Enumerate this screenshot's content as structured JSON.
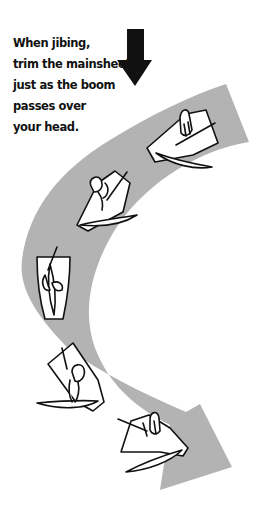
{
  "caption": {
    "lines": [
      "When jibing,",
      "trim the mainsheet",
      "just as the boom",
      "passes over",
      "your head."
    ]
  },
  "diagram": {
    "wind_arrow": {
      "icon": "wind-direction-down-arrow",
      "color": "#111111"
    },
    "path_arrow": {
      "icon": "curved-course-arrow",
      "color": "#b3b3b3"
    },
    "boats": [
      {
        "id": "boat-1",
        "stage": "approaching jibe"
      },
      {
        "id": "boat-2",
        "stage": "bearing away"
      },
      {
        "id": "boat-3",
        "stage": "dead downwind, boom crossing"
      },
      {
        "id": "boat-4",
        "stage": "after jibe"
      },
      {
        "id": "boat-5",
        "stage": "new course"
      }
    ]
  },
  "colors": {
    "background": "#ffffff",
    "text": "#111111",
    "path_gray": "#b3b3b3",
    "outline": "#111111",
    "boat_fill": "#ffffff"
  }
}
